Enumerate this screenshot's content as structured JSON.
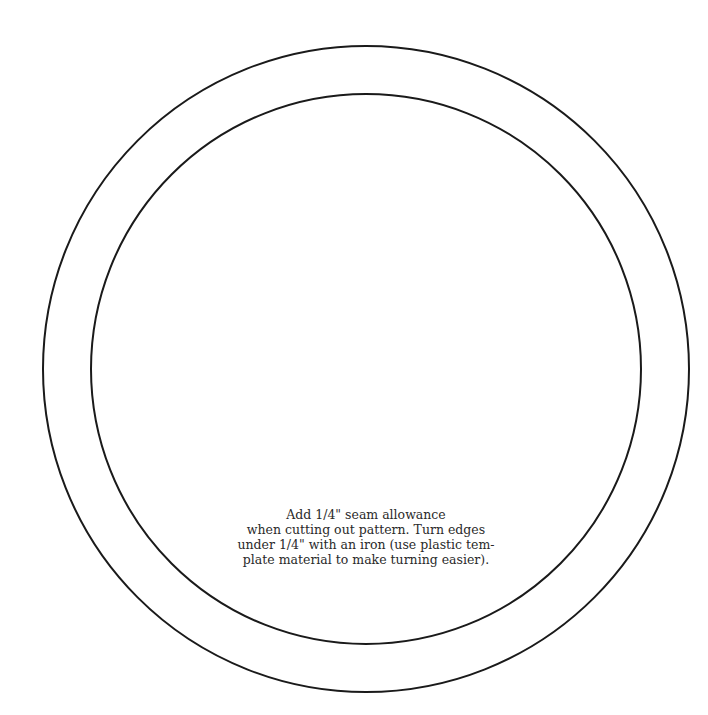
{
  "pattern": {
    "stroke_color": "#1a1a1a",
    "outer_circle": {
      "cx": 366,
      "cy": 369,
      "r": 323
    },
    "inner_circle": {
      "cx": 366,
      "cy": 369,
      "r": 275
    }
  },
  "instructions": {
    "lines": [
      "Add 1/4\" seam allowance",
      "when cutting out pattern. Turn edges",
      "under 1/4\" with an iron (use plastic tem-",
      "plate material to make turning easier)."
    ]
  }
}
